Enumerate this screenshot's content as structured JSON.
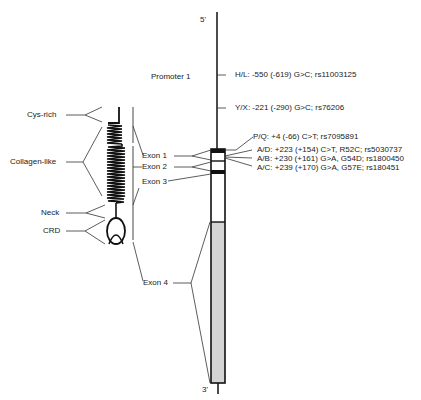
{
  "gene": {
    "five_prime": "5'",
    "three_prime": "3'",
    "promoter_label": "Promoter 1"
  },
  "variants": [
    {
      "id": "hl",
      "text": "H/L: -550 (-619) G>C; rs11003125"
    },
    {
      "id": "yx",
      "text": "Y/X: -221 (-290) G>C; rs76206"
    },
    {
      "id": "pq",
      "text": "P/Q: +4 (-66) C>T; rs7095891"
    },
    {
      "id": "ad",
      "text": "A/D: +223 (+154) C>T, R52C; rs5030737"
    },
    {
      "id": "ab",
      "text": "A/B: +230 (+161) G>A, G54D; rs1800450"
    },
    {
      "id": "ac",
      "text": "A/C: +239 (+170) G>A, G57E; rs180451"
    }
  ],
  "exons": [
    "Exon 1",
    "Exon 2",
    "Exon 3",
    "Exon 4"
  ],
  "protein_domains": [
    "Cys-rich",
    "Collagen-like",
    "Neck",
    "CRD"
  ],
  "colors": {
    "line": "#111111",
    "exon4_fill": "#d4d4d4",
    "text": "#222222"
  }
}
